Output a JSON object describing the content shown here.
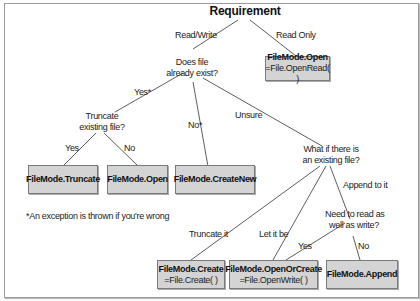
{
  "diagram": {
    "title": "Requirement",
    "footnote": "*An exception is thrown if you're wrong",
    "questions": {
      "exists": [
        "Does file",
        "already exist?"
      ],
      "truncate": [
        "Truncate",
        "existing file?"
      ],
      "existing": [
        "What if there is",
        "an existing file?"
      ],
      "readwrite": [
        "Need to read as",
        "well as write?"
      ]
    },
    "edges": {
      "read_write": "Read/Write",
      "read_only": "Read Only",
      "yes_star": "Yes*",
      "no_star": "No*",
      "unsure": "Unsure",
      "trunc_yes": "Yes",
      "trunc_no": "No",
      "truncate_it": "Truncate it",
      "let_it_be": "Let it be",
      "append_to_it": "Append to it",
      "rw_yes": "Yes",
      "rw_no": "No"
    },
    "outcomes": {
      "open_read": {
        "mode": "FileMode.Open",
        "method": "=File.OpenRead( )"
      },
      "truncate": {
        "mode": "FileMode.Truncate"
      },
      "open": {
        "mode": "FileMode.Open"
      },
      "create_new": {
        "mode": "FileMode.CreateNew"
      },
      "create": {
        "mode": "FileMode.Create",
        "method": "=File.Create( )"
      },
      "open_or_create": {
        "mode": "FileMode.OpenOrCreate",
        "method": "=File.OpenWrite( )"
      },
      "append": {
        "mode": "FileMode.Append"
      }
    },
    "colors": {
      "box_fill": "#d4d4d4",
      "box_border": "#7a7a7a",
      "line": "#333333"
    }
  }
}
